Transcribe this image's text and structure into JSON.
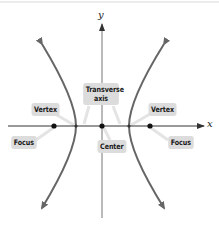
{
  "diagram": {
    "type": "hyperbola",
    "orientation": "horizontal transverse axis",
    "axes": {
      "x_label": "x",
      "y_label": "y"
    },
    "labels": {
      "transverse_axis_line1": "Transverse",
      "transverse_axis_line2": "axis",
      "vertex_left": "Vertex",
      "vertex_right": "Vertex",
      "focus_left": "Focus",
      "focus_right": "Focus",
      "center": "Center"
    },
    "points": [
      {
        "name": "focus-left",
        "x": 54,
        "y": 126
      },
      {
        "name": "vertex-left",
        "x": 76,
        "y": 126
      },
      {
        "name": "center",
        "x": 102,
        "y": 126
      },
      {
        "name": "vertex-right",
        "x": 129,
        "y": 126
      },
      {
        "name": "focus-right",
        "x": 150,
        "y": 126
      }
    ],
    "colors": {
      "curve": "#666666",
      "axis": "#333333",
      "label_bg": "#dcdcdc",
      "point": "#111111"
    }
  }
}
